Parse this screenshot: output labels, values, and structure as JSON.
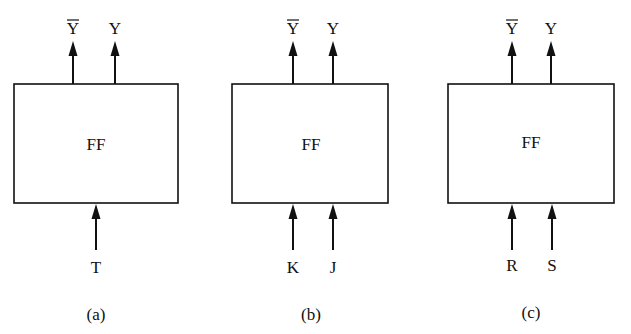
{
  "figure": {
    "panels": [
      {
        "id": "a",
        "caption": "(a)",
        "block_label": "FF",
        "outputs": [
          {
            "label": "Y",
            "overline": true
          },
          {
            "label": "Y",
            "overline": false
          }
        ],
        "inputs": [
          {
            "label": "T"
          }
        ]
      },
      {
        "id": "b",
        "caption": "(b)",
        "block_label": "FF",
        "outputs": [
          {
            "label": "Y",
            "overline": true
          },
          {
            "label": "Y",
            "overline": false
          }
        ],
        "inputs": [
          {
            "label": "K"
          },
          {
            "label": "J"
          }
        ]
      },
      {
        "id": "c",
        "caption": "(c)",
        "block_label": "FF",
        "outputs": [
          {
            "label": "Y",
            "overline": true
          },
          {
            "label": "Y",
            "overline": false
          }
        ],
        "inputs": [
          {
            "label": "R"
          },
          {
            "label": "S"
          }
        ]
      }
    ]
  }
}
